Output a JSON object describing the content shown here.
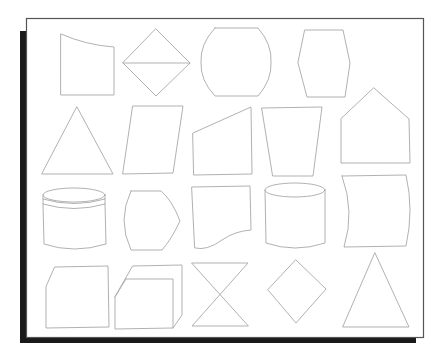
{
  "figure": {
    "title": "",
    "colors": {
      "background": "#ffffff",
      "shape_stroke": "#a8a8a8",
      "frame_stroke": "#555555",
      "shadow": "#1a1a1a"
    },
    "frame": {
      "x": 26,
      "y": 18,
      "width": 397,
      "height": 321
    },
    "rows": [
      {
        "shapes": [
          {
            "id": "curved-top-quadrilateral",
            "label": "Quadrilateral with curved top edge"
          },
          {
            "id": "diamond-with-diagonal",
            "label": "Diamond divided by horizontal line"
          },
          {
            "id": "barrel-shape",
            "label": "Barrel / rounded-side rectangle"
          },
          {
            "id": "hexagon",
            "label": "Hexagon"
          }
        ]
      },
      {
        "shapes": [
          {
            "id": "triangle",
            "label": "Triangle"
          },
          {
            "id": "parallelogram",
            "label": "Parallelogram"
          },
          {
            "id": "slanted-top-trapezoid",
            "label": "Right trapezoid with slanted top"
          },
          {
            "id": "inverted-trapezoid",
            "label": "Inverted trapezoid"
          },
          {
            "id": "pentagon-house",
            "label": "House-shaped pentagon"
          }
        ]
      },
      {
        "shapes": [
          {
            "id": "banded-cylinder",
            "label": "Cylinder with bands"
          },
          {
            "id": "curved-hexagon",
            "label": "Curved-left hexagon"
          },
          {
            "id": "wave-bottom-rectangle",
            "label": "Rectangle with wavy bottom"
          },
          {
            "id": "cylinder",
            "label": "Cylinder"
          },
          {
            "id": "concave-sides-rectangle",
            "label": "Rectangle with curved sides"
          }
        ]
      },
      {
        "shapes": [
          {
            "id": "chamfered-rectangle",
            "label": "Rectangle with chamfered corner"
          },
          {
            "id": "box-3d",
            "label": "3D box"
          },
          {
            "id": "hourglass",
            "label": "Hourglass / bowtie"
          },
          {
            "id": "rhombus",
            "label": "Rhombus"
          },
          {
            "id": "tall-triangle",
            "label": "Tall triangle"
          }
        ]
      }
    ]
  }
}
